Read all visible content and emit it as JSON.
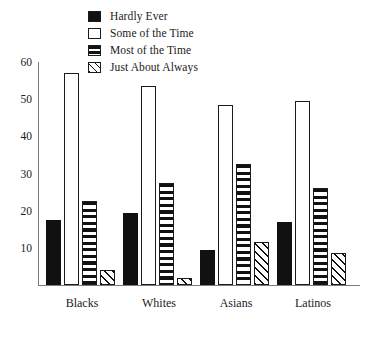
{
  "chart_data": {
    "type": "bar",
    "title": "",
    "subtitle": "",
    "xlabel": "",
    "ylabel": "",
    "categories": [
      "Blacks",
      "Whites",
      "Asians",
      "Latinos"
    ],
    "ylim": [
      0,
      60
    ],
    "yticks": [
      10,
      20,
      30,
      40,
      50,
      60
    ],
    "ytick_labels": [
      "10",
      "20",
      "30",
      "40",
      "50",
      "60"
    ],
    "grid": false,
    "legend_position": "top-center",
    "series": [
      {
        "name": "Hardly Ever",
        "fill": "solid-black",
        "color": "#111111",
        "values": [
          17.5,
          19.5,
          9.5,
          17
        ]
      },
      {
        "name": "Some of the Time",
        "fill": "empty-white",
        "color": "#ffffff",
        "values": [
          57,
          53.5,
          48.5,
          49.5
        ]
      },
      {
        "name": "Most of the Time",
        "fill": "horizontal-stripes",
        "color": "#111111",
        "values": [
          22.5,
          27.5,
          32.5,
          26
        ]
      },
      {
        "name": "Just About Always",
        "fill": "diagonal-stripes",
        "color": "#111111",
        "values": [
          4,
          2,
          11.5,
          8.5
        ]
      }
    ]
  },
  "legend": {
    "items": [
      {
        "label": "Hardly Ever",
        "swatch": "solid-black-swatch"
      },
      {
        "label": "Some of the Time",
        "swatch": "empty-white-swatch"
      },
      {
        "label": "Most of the Time",
        "swatch": "horizontal-stripes-swatch"
      },
      {
        "label": "Just About Always",
        "swatch": "diagonal-stripes-swatch"
      }
    ]
  },
  "axis": {
    "y_labels": [
      "60",
      "50",
      "40",
      "30",
      "20",
      "10"
    ],
    "x_labels": [
      "Blacks",
      "Whites",
      "Asians",
      "Latinos"
    ]
  }
}
